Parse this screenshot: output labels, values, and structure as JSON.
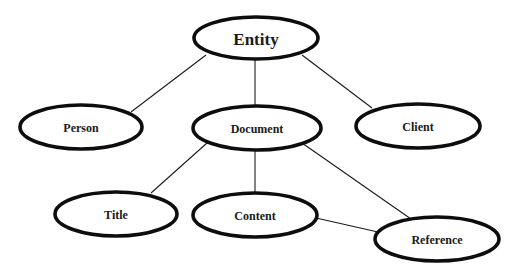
{
  "diagram": {
    "type": "entity-hierarchy",
    "nodes": [
      {
        "id": "entity",
        "label": "Entity",
        "cx": 256,
        "cy": 38,
        "rx": 62,
        "ry": 21,
        "font_size": 17
      },
      {
        "id": "person",
        "label": "Person",
        "cx": 81,
        "cy": 127,
        "rx": 61,
        "ry": 22,
        "font_size": 12
      },
      {
        "id": "document",
        "label": "Document",
        "cx": 257,
        "cy": 128,
        "rx": 64,
        "ry": 22,
        "font_size": 12
      },
      {
        "id": "client",
        "label": "Client",
        "cx": 418,
        "cy": 126,
        "rx": 62,
        "ry": 22,
        "font_size": 12
      },
      {
        "id": "title",
        "label": "Title",
        "cx": 116,
        "cy": 214,
        "rx": 61,
        "ry": 22,
        "font_size": 12
      },
      {
        "id": "content",
        "label": "Content",
        "cx": 255,
        "cy": 215,
        "rx": 62,
        "ry": 22,
        "font_size": 12
      },
      {
        "id": "reference",
        "label": "Reference",
        "cx": 437,
        "cy": 239,
        "rx": 62,
        "ry": 22,
        "font_size": 12
      }
    ],
    "edges": [
      {
        "from": "entity",
        "to": "person",
        "x1": 206,
        "y1": 55,
        "x2": 131,
        "y2": 112
      },
      {
        "from": "entity",
        "to": "document",
        "x1": 255,
        "y1": 59,
        "x2": 255,
        "y2": 106
      },
      {
        "from": "entity",
        "to": "client",
        "x1": 302,
        "y1": 55,
        "x2": 372,
        "y2": 108
      },
      {
        "from": "document",
        "to": "title",
        "x1": 207,
        "y1": 143,
        "x2": 151,
        "y2": 193
      },
      {
        "from": "document",
        "to": "content",
        "x1": 255,
        "y1": 150,
        "x2": 255,
        "y2": 193
      },
      {
        "from": "document",
        "to": "reference",
        "x1": 302,
        "y1": 143,
        "x2": 411,
        "y2": 219
      },
      {
        "from": "content",
        "to": "reference",
        "x1": 316,
        "y1": 218,
        "x2": 378,
        "y2": 232
      }
    ],
    "colors": {
      "background": "#ffffff",
      "stroke": "#0d0d0d",
      "text": "#1a1a1a"
    }
  }
}
